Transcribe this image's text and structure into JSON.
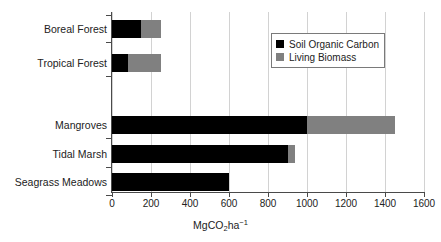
{
  "chart_data": {
    "type": "bar",
    "orientation": "horizontal",
    "stacked": true,
    "title": "",
    "xlabel": "MgCO2ha-1",
    "xlabel_parts": {
      "prefix": "MgCO",
      "sub": "2",
      "mid": "ha",
      "sup": "−1"
    },
    "ylabel": "",
    "categories": [
      "Boreal Forest",
      "Tropical Forest",
      "Mangroves",
      "Tidal Marsh",
      "Seagrass Meadows"
    ],
    "series": [
      {
        "name": "Soil Organic Carbon",
        "color": "#000000",
        "values": [
          150,
          80,
          1000,
          900,
          600
        ]
      },
      {
        "name": "Living Biomass",
        "color": "#808080",
        "values": [
          100,
          170,
          450,
          40,
          0
        ]
      }
    ],
    "totals": [
      250,
      250,
      1450,
      940,
      600
    ],
    "xlim": [
      0,
      1600
    ],
    "xticks": [
      0,
      200,
      400,
      600,
      800,
      1000,
      1200,
      1400,
      1600
    ],
    "xtick_labels": [
      "0",
      "200",
      "400",
      "600",
      "800",
      "1000",
      "1200",
      "1400",
      "1600"
    ],
    "grid": {
      "vertical": true,
      "horizontal": false,
      "color": "#d2d2d2"
    },
    "legend": {
      "position": "top-right",
      "entries": [
        "Soil Organic Carbon",
        "Living Biomass"
      ]
    },
    "background": "#ffffff",
    "axis_color": "#4a4a4a",
    "row_positions": [
      8,
      42,
      104,
      133,
      161
    ],
    "bar_height": 18
  }
}
